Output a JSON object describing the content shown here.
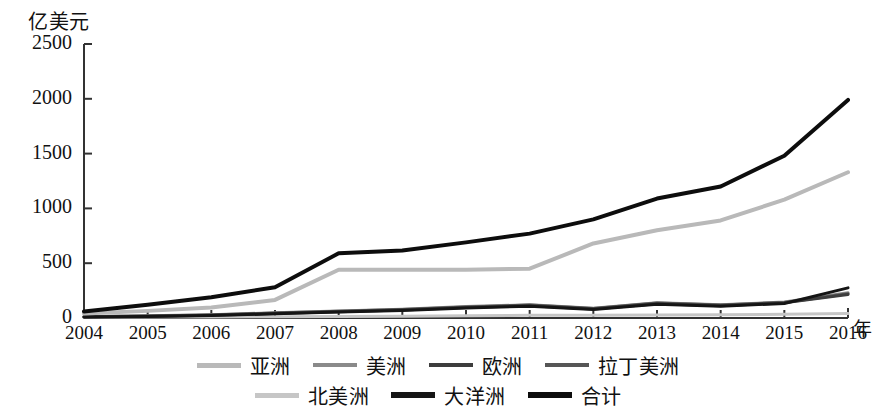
{
  "axis": {
    "y_unit_label": "亿美元",
    "x_unit_label": "年",
    "y_ticks": [
      "2500",
      "2000",
      "1500",
      "1000",
      "500",
      "0"
    ],
    "x_ticks": [
      "2004",
      "2005",
      "2006",
      "2007",
      "2008",
      "2009",
      "2010",
      "2011",
      "2012",
      "2013",
      "2014",
      "2015",
      "2016"
    ]
  },
  "legend": {
    "rows": [
      [
        {
          "label": "亚洲",
          "color": "#b9b9b9"
        },
        {
          "label": "美洲",
          "color": "#8a8a8a"
        },
        {
          "label": "欧洲",
          "color": "#3d3d3d"
        },
        {
          "label": "拉丁美洲",
          "color": "#565656"
        }
      ],
      [
        {
          "label": "北美洲",
          "color": "#c6c6c6"
        },
        {
          "label": "大洋洲",
          "color": "#151515"
        },
        {
          "label": "合计",
          "color": "#0d0d0d"
        }
      ]
    ]
  },
  "chart_data": {
    "type": "line",
    "title": "",
    "xlabel": "年",
    "ylabel": "亿美元",
    "ylim": [
      0,
      2500
    ],
    "grid": false,
    "legend_position": "bottom",
    "x": [
      2004,
      2005,
      2006,
      2007,
      2008,
      2009,
      2010,
      2011,
      2012,
      2013,
      2014,
      2015,
      2016
    ],
    "series": [
      {
        "name": "亚洲",
        "color": "#b9b9b9",
        "width": 4,
        "values": [
          40,
          65,
          95,
          165,
          440,
          440,
          440,
          450,
          680,
          800,
          890,
          1080,
          1330
        ]
      },
      {
        "name": "美洲",
        "color": "#8a8a8a",
        "width": 3,
        "values": [
          14,
          20,
          30,
          48,
          65,
          80,
          105,
          120,
          90,
          140,
          120,
          145,
          230
        ]
      },
      {
        "name": "欧洲",
        "color": "#3d3d3d",
        "width": 3,
        "values": [
          10,
          16,
          25,
          42,
          58,
          72,
          96,
          112,
          82,
          130,
          112,
          138,
          215
        ]
      },
      {
        "name": "拉丁美洲",
        "color": "#565656",
        "width": 3,
        "values": [
          12,
          18,
          28,
          45,
          62,
          78,
          100,
          118,
          86,
          136,
          118,
          142,
          222
        ]
      },
      {
        "name": "北美洲",
        "color": "#c6c6c6",
        "width": 3,
        "values": [
          6,
          8,
          10,
          12,
          14,
          16,
          20,
          24,
          26,
          28,
          30,
          34,
          40
        ]
      },
      {
        "name": "大洋洲",
        "color": "#151515",
        "width": 3,
        "values": [
          8,
          14,
          22,
          38,
          55,
          68,
          92,
          108,
          78,
          126,
          108,
          132,
          275
        ]
      },
      {
        "name": "合计",
        "color": "#0d0d0d",
        "width": 4,
        "values": [
          60,
          120,
          190,
          280,
          590,
          615,
          690,
          770,
          900,
          1090,
          1200,
          1480,
          1990
        ]
      }
    ]
  }
}
